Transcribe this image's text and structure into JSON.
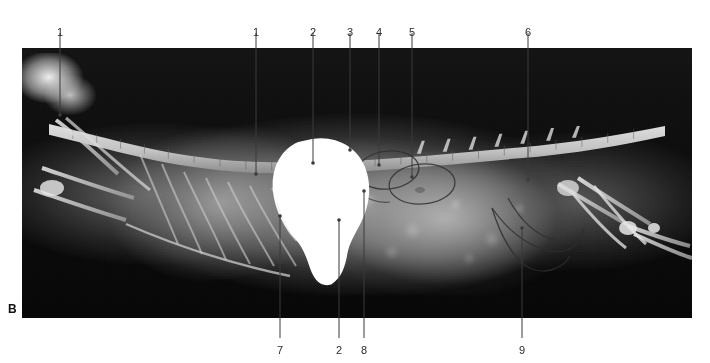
{
  "figure": {
    "panel_letter": "B",
    "modality": "radiograph",
    "view": "lateral abdominal radiograph with positive contrast in stomach",
    "caption": "",
    "plate": {
      "x": 22,
      "y": 48,
      "width": 670,
      "height": 270,
      "background_color": "#0b0b0b",
      "tissue_color": "#b4b4b4",
      "contrast_color": "#ffffff"
    },
    "annotation_style": {
      "line_color": "#3a3a3a",
      "line_width": 1,
      "dot_radius": 1.8,
      "number_color": "#2b2b2b",
      "number_size_px": 11
    }
  },
  "labels": [
    {
      "id": "L1a",
      "text": "1",
      "label_x": 60,
      "label_y": 27,
      "line_x": 60,
      "line_y1": 33,
      "line_y2": 115,
      "side": "top"
    },
    {
      "id": "L1b",
      "text": "1",
      "label_x": 256,
      "label_y": 27,
      "line_x": 256,
      "line_y1": 33,
      "line_y2": 174,
      "side": "top"
    },
    {
      "id": "L2a",
      "text": "2",
      "label_x": 313,
      "label_y": 27,
      "line_x": 313,
      "line_y1": 33,
      "line_y2": 163,
      "side": "top"
    },
    {
      "id": "L3",
      "text": "3",
      "label_x": 350,
      "label_y": 27,
      "line_x": 350,
      "line_y1": 33,
      "line_y2": 150,
      "side": "top"
    },
    {
      "id": "L4",
      "text": "4",
      "label_x": 379,
      "label_y": 27,
      "line_x": 379,
      "line_y1": 33,
      "line_y2": 165,
      "side": "top"
    },
    {
      "id": "L5",
      "text": "5",
      "label_x": 412,
      "label_y": 27,
      "line_x": 412,
      "line_y1": 33,
      "line_y2": 177,
      "side": "top"
    },
    {
      "id": "L6",
      "text": "6",
      "label_x": 528,
      "label_y": 27,
      "line_x": 528,
      "line_y1": 33,
      "line_y2": 180,
      "side": "top"
    },
    {
      "id": "L7",
      "text": "7",
      "label_x": 280,
      "label_y": 345,
      "line_x": 280,
      "line_y1": 216,
      "line_y2": 338,
      "side": "bottom"
    },
    {
      "id": "L2b",
      "text": "2",
      "label_x": 339,
      "label_y": 345,
      "line_x": 339,
      "line_y1": 220,
      "line_y2": 338,
      "side": "bottom"
    },
    {
      "id": "L8",
      "text": "8",
      "label_x": 364,
      "label_y": 345,
      "line_x": 364,
      "line_y1": 191,
      "line_y2": 338,
      "side": "bottom"
    },
    {
      "id": "L9",
      "text": "9",
      "label_x": 522,
      "label_y": 345,
      "line_x": 522,
      "line_y1": 228,
      "line_y2": 338,
      "side": "bottom"
    }
  ]
}
